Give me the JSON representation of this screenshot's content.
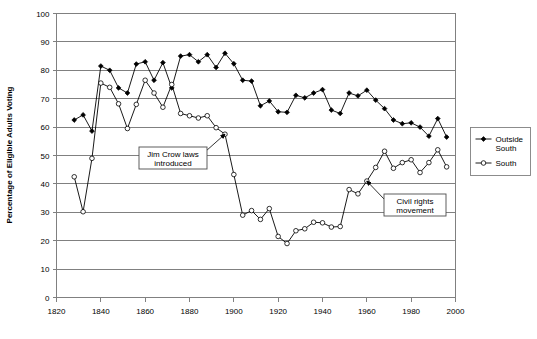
{
  "chart_data": {
    "type": "line",
    "title": "",
    "xlabel": "",
    "ylabel": "Percentage of Eligible Adults Voting",
    "xlim": [
      1820,
      2000
    ],
    "ylim": [
      0,
      100
    ],
    "grid": true,
    "legend_position": "right",
    "x_ticks": [
      1820,
      1840,
      1860,
      1880,
      1900,
      1920,
      1940,
      1960,
      1980,
      2000
    ],
    "y_ticks": [
      0,
      10,
      20,
      30,
      40,
      50,
      60,
      70,
      80,
      90,
      100
    ],
    "series": [
      {
        "name": "Outside South",
        "marker": "filled-diamond",
        "x": [
          1828,
          1832,
          1836,
          1840,
          1844,
          1848,
          1852,
          1856,
          1860,
          1864,
          1868,
          1872,
          1876,
          1880,
          1884,
          1888,
          1892,
          1896,
          1900,
          1904,
          1908,
          1912,
          1916,
          1920,
          1924,
          1928,
          1932,
          1936,
          1940,
          1944,
          1948,
          1952,
          1956,
          1960,
          1964,
          1968,
          1972,
          1976,
          1980,
          1984,
          1988,
          1992,
          1996
        ],
        "values": [
          62.5,
          64.3,
          58.6,
          81.5,
          80.0,
          73.8,
          72.0,
          82.2,
          83.0,
          76.5,
          82.7,
          73.8,
          85.0,
          85.5,
          83.0,
          85.5,
          81.0,
          86.0,
          82.3,
          76.5,
          76.2,
          67.5,
          69.2,
          65.4,
          65.2,
          71.2,
          70.3,
          72.0,
          73.2,
          66.0,
          64.8,
          72.0,
          71.0,
          73.0,
          69.5,
          66.5,
          62.5,
          61.2,
          61.5,
          60.0,
          56.8,
          63.0,
          56.5
        ]
      },
      {
        "name": "South",
        "marker": "open-circle",
        "x": [
          1828,
          1832,
          1836,
          1840,
          1844,
          1848,
          1852,
          1856,
          1860,
          1864,
          1868,
          1872,
          1876,
          1880,
          1884,
          1888,
          1892,
          1896,
          1900,
          1904,
          1908,
          1912,
          1916,
          1920,
          1924,
          1928,
          1932,
          1936,
          1940,
          1944,
          1948,
          1952,
          1956,
          1960,
          1964,
          1968,
          1972,
          1976,
          1980,
          1984,
          1988,
          1992,
          1996
        ],
        "values": [
          42.5,
          30.2,
          49.0,
          75.5,
          74.0,
          68.2,
          59.5,
          68.0,
          76.5,
          72.0,
          67.0,
          75.0,
          64.8,
          64.0,
          63.2,
          64.0,
          59.8,
          57.5,
          43.3,
          29.0,
          30.6,
          27.5,
          31.3,
          21.5,
          19.0,
          23.5,
          24.2,
          26.5,
          26.3,
          24.8,
          25.0,
          38.0,
          36.5,
          41.0,
          45.8,
          51.5,
          45.5,
          47.5,
          48.5,
          44.0,
          47.5,
          52.0,
          46.0
        ]
      }
    ],
    "annotations": [
      {
        "id": "jim-crow",
        "text_line1": "Jim Crow laws",
        "text_line2": "introduced",
        "target_year": 1896,
        "target_value": 57.5
      },
      {
        "id": "civil-rights",
        "text_line1": "Civil rights",
        "text_line2": "movement",
        "target_year": 1960,
        "target_value": 41.0
      }
    ]
  },
  "legend": {
    "items": [
      {
        "label_line1": "Outside",
        "label_line2": "South",
        "marker": "filled-diamond"
      },
      {
        "label_line1": "South",
        "label_line2": "",
        "marker": "open-circle"
      }
    ]
  },
  "colors": {
    "series_stroke": "#000000",
    "grid": "#808080",
    "background": "#ffffff",
    "annotation_border": "#4d4d4d"
  }
}
